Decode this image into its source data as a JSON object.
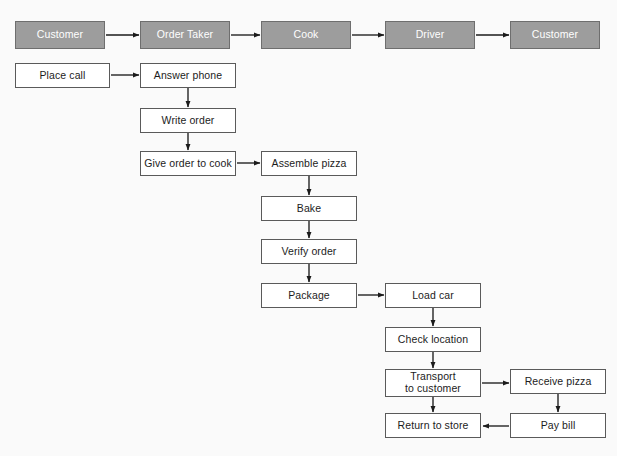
{
  "diagram": {
    "type": "swimlane-flowchart",
    "background_color": "#fafafa",
    "role_fill_color": "#9d9d9d",
    "role_text_color": "#ffffff",
    "node_fill_color": "#ffffff",
    "node_border_color": "#5a5a5a",
    "node_text_color": "#1c1c1c",
    "roles": [
      {
        "id": "role-customer-left",
        "label": "Customer",
        "x": 15,
        "y": 21,
        "w": 90,
        "h": 28
      },
      {
        "id": "role-order-taker",
        "label": "Order Taker",
        "x": 140,
        "y": 21,
        "w": 90,
        "h": 28
      },
      {
        "id": "role-cook",
        "label": "Cook",
        "x": 261,
        "y": 21,
        "w": 90,
        "h": 28
      },
      {
        "id": "role-driver",
        "label": "Driver",
        "x": 385,
        "y": 21,
        "w": 90,
        "h": 28
      },
      {
        "id": "role-customer-right",
        "label": "Customer",
        "x": 510,
        "y": 21,
        "w": 90,
        "h": 28
      }
    ],
    "steps": [
      {
        "id": "step-place-call",
        "label": "Place call",
        "x": 15,
        "y": 63,
        "w": 95,
        "h": 25
      },
      {
        "id": "step-answer-phone",
        "label": "Answer phone",
        "x": 140,
        "y": 63,
        "w": 96,
        "h": 25
      },
      {
        "id": "step-write-order",
        "label": "Write order",
        "x": 140,
        "y": 108,
        "w": 96,
        "h": 25
      },
      {
        "id": "step-give-order-to-cook",
        "label": "Give order to cook",
        "x": 140,
        "y": 151,
        "w": 96,
        "h": 25
      },
      {
        "id": "step-assemble-pizza",
        "label": "Assemble pizza",
        "x": 261,
        "y": 151,
        "w": 96,
        "h": 25
      },
      {
        "id": "step-bake",
        "label": "Bake",
        "x": 261,
        "y": 196,
        "w": 96,
        "h": 25
      },
      {
        "id": "step-verify-order",
        "label": "Verify order",
        "x": 261,
        "y": 239,
        "w": 96,
        "h": 25
      },
      {
        "id": "step-package",
        "label": "Package",
        "x": 261,
        "y": 283,
        "w": 96,
        "h": 25
      },
      {
        "id": "step-load-car",
        "label": "Load car",
        "x": 385,
        "y": 283,
        "w": 96,
        "h": 25
      },
      {
        "id": "step-check-location",
        "label": "Check location",
        "x": 385,
        "y": 327,
        "w": 96,
        "h": 25
      },
      {
        "id": "step-transport-to-customer",
        "label": "Transport\nto customer",
        "x": 385,
        "y": 369,
        "w": 96,
        "h": 28
      },
      {
        "id": "step-return-to-store",
        "label": "Return to store",
        "x": 385,
        "y": 413,
        "w": 96,
        "h": 25
      },
      {
        "id": "step-receive-pizza",
        "label": "Receive pizza",
        "x": 510,
        "y": 369,
        "w": 96,
        "h": 25
      },
      {
        "id": "step-pay-bill",
        "label": "Pay bill",
        "x": 510,
        "y": 413,
        "w": 96,
        "h": 25
      }
    ],
    "connections": [
      {
        "from": "role-customer-left",
        "to": "role-order-taker",
        "direction": "right"
      },
      {
        "from": "role-order-taker",
        "to": "role-cook",
        "direction": "right"
      },
      {
        "from": "role-cook",
        "to": "role-driver",
        "direction": "right"
      },
      {
        "from": "role-driver",
        "to": "role-customer-right",
        "direction": "right"
      },
      {
        "from": "step-place-call",
        "to": "step-answer-phone",
        "direction": "right"
      },
      {
        "from": "step-answer-phone",
        "to": "step-write-order",
        "direction": "down"
      },
      {
        "from": "step-write-order",
        "to": "step-give-order-to-cook",
        "direction": "down"
      },
      {
        "from": "step-give-order-to-cook",
        "to": "step-assemble-pizza",
        "direction": "right"
      },
      {
        "from": "step-assemble-pizza",
        "to": "step-bake",
        "direction": "down"
      },
      {
        "from": "step-bake",
        "to": "step-verify-order",
        "direction": "down"
      },
      {
        "from": "step-verify-order",
        "to": "step-package",
        "direction": "down"
      },
      {
        "from": "step-package",
        "to": "step-load-car",
        "direction": "right"
      },
      {
        "from": "step-load-car",
        "to": "step-check-location",
        "direction": "down"
      },
      {
        "from": "step-check-location",
        "to": "step-transport-to-customer",
        "direction": "down"
      },
      {
        "from": "step-transport-to-customer",
        "to": "step-receive-pizza",
        "direction": "right"
      },
      {
        "from": "step-transport-to-customer",
        "to": "step-return-to-store",
        "direction": "down"
      },
      {
        "from": "step-receive-pizza",
        "to": "step-pay-bill",
        "direction": "down"
      },
      {
        "from": "step-pay-bill",
        "to": "step-return-to-store",
        "direction": "left"
      }
    ]
  }
}
